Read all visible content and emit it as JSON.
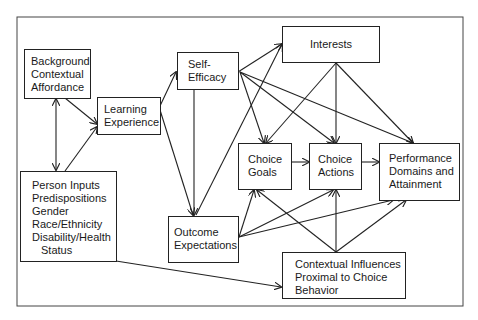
{
  "diagram": {
    "nodes": {
      "background": {
        "lines": [
          "Background",
          "Contextual",
          "Affordance"
        ]
      },
      "learning": {
        "lines": [
          "Learning",
          "Experience"
        ]
      },
      "self_efficacy": {
        "lines": [
          "Self-",
          "Efficacy"
        ]
      },
      "interests": {
        "lines": [
          "Interests"
        ]
      },
      "choice_goals": {
        "lines": [
          "Choice",
          "Goals"
        ]
      },
      "choice_actions": {
        "lines": [
          "Choice",
          "Actions"
        ]
      },
      "performance": {
        "lines": [
          "Performance",
          "Domains and",
          "Attainment"
        ]
      },
      "person_inputs": {
        "lines": [
          "Person Inputs",
          "Predispositions",
          "Gender",
          "Race/Ethnicity",
          "Disability/Health",
          "Status"
        ]
      },
      "outcome_expectations": {
        "lines": [
          "Outcome",
          "Expectations"
        ]
      },
      "contextual_influences": {
        "lines": [
          "Contextual Influences",
          "Proximal to Choice",
          "Behavior"
        ]
      }
    },
    "edges": [
      {
        "from": "background",
        "to": "learning"
      },
      {
        "from": "background",
        "to": "person_inputs",
        "bidirectional": true
      },
      {
        "from": "person_inputs",
        "to": "learning"
      },
      {
        "from": "learning",
        "to": "self_efficacy"
      },
      {
        "from": "learning",
        "to": "outcome_expectations"
      },
      {
        "from": "self_efficacy",
        "to": "outcome_expectations"
      },
      {
        "from": "self_efficacy",
        "to": "interests"
      },
      {
        "from": "self_efficacy",
        "to": "choice_goals"
      },
      {
        "from": "self_efficacy",
        "to": "choice_actions"
      },
      {
        "from": "self_efficacy",
        "to": "performance"
      },
      {
        "from": "outcome_expectations",
        "to": "interests"
      },
      {
        "from": "outcome_expectations",
        "to": "choice_goals"
      },
      {
        "from": "outcome_expectations",
        "to": "choice_actions"
      },
      {
        "from": "outcome_expectations",
        "to": "performance"
      },
      {
        "from": "interests",
        "to": "choice_goals"
      },
      {
        "from": "interests",
        "to": "choice_actions"
      },
      {
        "from": "interests",
        "to": "performance"
      },
      {
        "from": "choice_goals",
        "to": "choice_actions"
      },
      {
        "from": "choice_actions",
        "to": "performance"
      },
      {
        "from": "contextual_influences",
        "to": "choice_goals"
      },
      {
        "from": "contextual_influences",
        "to": "choice_actions"
      },
      {
        "from": "contextual_influences",
        "to": "performance"
      },
      {
        "from": "person_inputs",
        "to": "contextual_influences"
      }
    ],
    "caption": "partially visible caption text (cut off at bottom edge)"
  }
}
